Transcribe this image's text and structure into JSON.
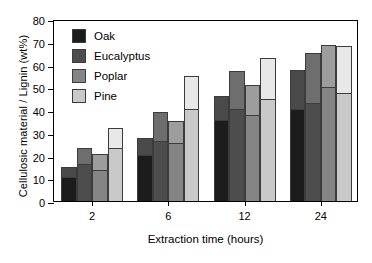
{
  "chart_data": {
    "type": "bar",
    "stacked": true,
    "title": "",
    "xlabel": "Extraction time (hours)",
    "ylabel": "Cellulosic material / Lignin (wt%)",
    "categories": [
      "2",
      "6",
      "12",
      "24"
    ],
    "ylim": [
      0,
      80
    ],
    "yticks": [
      0,
      10,
      20,
      30,
      40,
      50,
      60,
      70,
      80
    ],
    "grid": false,
    "legend_position": "top-left",
    "series": [
      {
        "name": "Oak",
        "color": "#1c1c1c",
        "upper_color": "#4a4a4a",
        "values": [
          15,
          27.5,
          46,
          57.5
        ],
        "lower_values": [
          10,
          20,
          35,
          40
        ]
      },
      {
        "name": "Eucalyptus",
        "color": "#4d4d4d",
        "upper_color": "#6e6e6e",
        "values": [
          23.5,
          39,
          57,
          65
        ],
        "lower_values": [
          16,
          26,
          40,
          42.5
        ]
      },
      {
        "name": "Poplar",
        "color": "#858585",
        "upper_color": "#9d9d9d",
        "values": [
          20.5,
          35,
          51,
          68.5
        ],
        "lower_values": [
          13,
          25,
          37.5,
          49.5
        ]
      },
      {
        "name": "Pine",
        "color": "#c9c9c9",
        "upper_color": "#e8e8e8",
        "values": [
          32,
          55,
          63,
          68
        ],
        "lower_values": [
          23,
          40,
          44.5,
          47
        ]
      }
    ]
  },
  "legend": {
    "items": [
      {
        "label": "Oak",
        "color": "#1c1c1c"
      },
      {
        "label": "Eucalyptus",
        "color": "#4d4d4d"
      },
      {
        "label": "Poplar",
        "color": "#858585"
      },
      {
        "label": "Pine",
        "color": "#c9c9c9"
      }
    ]
  },
  "axes": {
    "y_title": "Cellulosic material / Lignin (wt%)",
    "x_title": "Extraction time (hours)",
    "y_tick_labels": [
      "0",
      "10",
      "20",
      "30",
      "40",
      "50",
      "60",
      "70",
      "80"
    ],
    "x_tick_labels": [
      "2",
      "6",
      "12",
      "24"
    ]
  }
}
